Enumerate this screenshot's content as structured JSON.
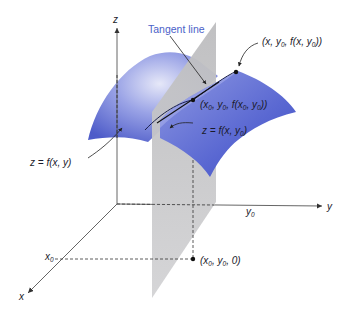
{
  "diagram": {
    "axes": {
      "x_label": "x",
      "y_label": "y",
      "z_label": "z",
      "x0_label": "x",
      "x0_sub": "0",
      "y0_label": "y",
      "y0_sub": "0"
    },
    "labels": {
      "tangent_line": "Tangent line",
      "surface": "z = f(x, y)",
      "curve": "z = f(x, y",
      "curve_sub": "0",
      "curve_close": ")",
      "point_top": {
        "p1": "(x, y",
        "s1": "0",
        "p2": ", f(x, y",
        "s2": "0",
        "p3": "))"
      },
      "point_tangent": {
        "p1": "(x",
        "s1": "0",
        "p2": ", y",
        "s2": "0",
        "p3": ", f(x",
        "s3": "0",
        "p4": ", y",
        "s4": "0",
        "p5": "))"
      },
      "point_base": {
        "p1": "(x",
        "s1": "0",
        "p2": ", y",
        "s2": "0",
        "p3": ", 0)"
      }
    },
    "colors": {
      "surface": "#6a78d8",
      "surface_light": "#c8ccf0",
      "plane": "#c9c9cb",
      "axis": "#555555",
      "label_accent": "#4a5fc8"
    }
  }
}
